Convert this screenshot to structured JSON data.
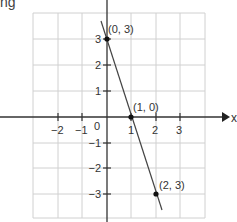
{
  "page": {
    "top_left_text_fragment": "ng"
  },
  "axes": {
    "x_label": "x",
    "x_ticks": [
      "−2",
      "−1",
      "0",
      "1",
      "2",
      "3"
    ],
    "y_ticks": [
      "3",
      "2",
      "1",
      "−1",
      "−2",
      "−3"
    ],
    "origin_label": "0"
  },
  "points": [
    {
      "label": "(0, 3)",
      "x": 0,
      "y": 3
    },
    {
      "label": "(1, 0)",
      "x": 1,
      "y": 0
    },
    {
      "label": "(2, 3)",
      "x": 2,
      "y": -3,
      "note": "label as printed in image; plotted position is y = -3"
    }
  ],
  "line": {
    "description": "straight line through (0, 3), (1, 0), (2, -3)",
    "slope": -3,
    "intercept": 3
  },
  "colors": {
    "grid": "#d0d0d0",
    "axis": "#333333",
    "line": "#444444",
    "point": "#111111",
    "background": "#ffffff"
  }
}
